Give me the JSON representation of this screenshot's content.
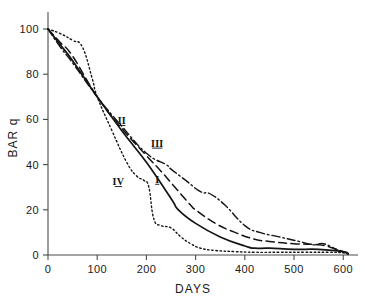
{
  "chart_data": {
    "type": "line",
    "title": "",
    "subtitle": "",
    "xlabel": "DAYS",
    "ylabel": "BAR q",
    "xlim": [
      0,
      630
    ],
    "ylim": [
      0,
      104
    ],
    "grid": false,
    "legend_position": "inline-curve-labels",
    "xticks": [
      0,
      100,
      200,
      300,
      400,
      500,
      600
    ],
    "xticklabels": [
      "0",
      "100",
      "200",
      "300",
      "400",
      "500",
      "600"
    ],
    "yticks": [
      0,
      20,
      40,
      60,
      80,
      100
    ],
    "yticklabels": [
      "0",
      "20",
      "40",
      "60",
      "80",
      "100"
    ],
    "annotations": [
      {
        "text": "II",
        "x": 150,
        "y": 58
      },
      {
        "text": "III",
        "x": 222,
        "y": 48
      },
      {
        "text": "IV",
        "x": 143,
        "y": 31
      },
      {
        "text": "I",
        "x": 222,
        "y": 32
      }
    ],
    "series": [
      {
        "name": "I",
        "label": "I",
        "linestyle": "solid",
        "color": "#141414",
        "x": [
          0,
          25,
          50,
          100,
          150,
          200,
          250,
          265,
          300,
          350,
          400,
          420,
          450,
          500,
          550,
          600,
          610
        ],
        "values": [
          100,
          93,
          86,
          70,
          55,
          41,
          25,
          20,
          14,
          8,
          4,
          3,
          3,
          2.5,
          2.5,
          1.5,
          0.5
        ]
      },
      {
        "name": "II",
        "label": "II",
        "linestyle": "dashed",
        "color": "#141414",
        "x": [
          0,
          25,
          50,
          100,
          150,
          200,
          230,
          250,
          290,
          300,
          340,
          380,
          420,
          450,
          500,
          550,
          580,
          600,
          610
        ],
        "values": [
          100,
          94,
          88,
          70,
          56,
          44,
          37,
          32,
          22,
          20,
          14,
          10,
          7,
          6,
          5,
          4.5,
          3,
          1.5,
          0.5
        ]
      },
      {
        "name": "III",
        "label": "III",
        "linestyle": "dashdot",
        "color": "#141414",
        "x": [
          0,
          25,
          50,
          100,
          150,
          200,
          240,
          250,
          280,
          310,
          330,
          360,
          400,
          430,
          470,
          510,
          540,
          560,
          590,
          605,
          610
        ],
        "values": [
          100,
          92,
          85,
          70,
          57,
          45,
          40,
          38,
          33,
          28,
          27,
          22,
          13,
          10,
          8,
          6,
          4.5,
          5,
          2,
          0.8,
          0.5
        ]
      },
      {
        "name": "IV",
        "label": "IV",
        "linestyle": "dotted",
        "color": "#141414",
        "x": [
          0,
          25,
          50,
          70,
          90,
          100,
          130,
          160,
          180,
          195,
          205,
          215,
          230,
          250,
          270,
          290,
          310,
          340,
          380,
          420,
          470,
          520,
          570,
          600,
          610
        ],
        "values": [
          100,
          98,
          95,
          92,
          78,
          70,
          55,
          41,
          35,
          33,
          30,
          16,
          13,
          12,
          8,
          5,
          3,
          2,
          1.5,
          1.2,
          1.2,
          1.2,
          1.2,
          1,
          0.5
        ]
      }
    ]
  }
}
